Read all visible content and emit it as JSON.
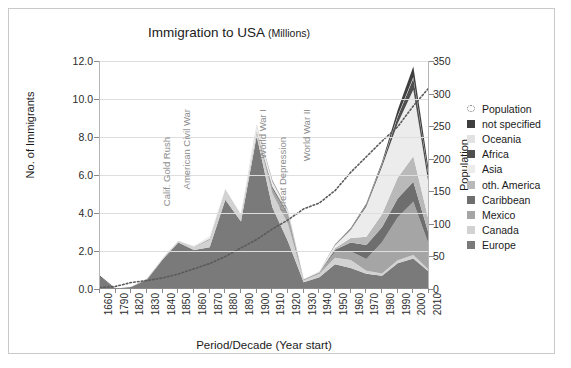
{
  "chart": {
    "title": "Immigration to USA",
    "title_unit": "(Millions)",
    "xlabel": "Period/Decade (Year start)",
    "ylabel_left": "No. of Immigrants",
    "ylabel_right": "Population"
  },
  "axes": {
    "left_ticks": [
      "0.0",
      "2.0",
      "4.0",
      "6.0",
      "8.0",
      "10.0",
      "12.0"
    ],
    "right_ticks": [
      "0",
      "50",
      "100",
      "150",
      "200",
      "250",
      "300",
      "350"
    ]
  },
  "legend": {
    "items": [
      {
        "label": "Population",
        "color": "#7d7d7d",
        "marker": "dotted-circle"
      },
      {
        "label": "not specified",
        "color": "#3f3f3f",
        "marker": "square"
      },
      {
        "label": "Oceania",
        "color": "#e2e2e2",
        "marker": "square"
      },
      {
        "label": "Africa",
        "color": "#4f4f4f",
        "marker": "square"
      },
      {
        "label": "Asia",
        "color": "#ececec",
        "marker": "square"
      },
      {
        "label": "oth. America",
        "color": "#b9b9b9",
        "marker": "square"
      },
      {
        "label": "Caribbean",
        "color": "#6e6e6e",
        "marker": "square"
      },
      {
        "label": "Mexico",
        "color": "#a5a5a5",
        "marker": "square"
      },
      {
        "label": "Canada",
        "color": "#d2d2d2",
        "marker": "square"
      },
      {
        "label": "Europe",
        "color": "#7a7a7a",
        "marker": "square"
      }
    ]
  },
  "annotations": [
    {
      "text": "Calif. Gold Rush",
      "x_year": "1850",
      "px": 152,
      "py": 128
    },
    {
      "text": "American Civil War",
      "x_year": "1860",
      "px": 172,
      "py": 100
    },
    {
      "text": "World War I",
      "x_year": "1910",
      "px": 248,
      "py": 100
    },
    {
      "text": "Great Depression",
      "x_year": "1930",
      "px": 268,
      "py": 128
    },
    {
      "text": "World War II",
      "x_year": "1940",
      "px": 292,
      "py": 100
    }
  ],
  "chart_data": {
    "type": "area",
    "title": "Immigration to USA (Millions)",
    "xlabel": "Period/Decade (Year start)",
    "ylabel": "No. of Immigrants",
    "ylabel_secondary": "Population",
    "ylim": [
      0,
      12
    ],
    "ylim_secondary": [
      0,
      350
    ],
    "grid": true,
    "legend_position": "right",
    "stacked": true,
    "categories": [
      "1660",
      "1790",
      "1820",
      "1830",
      "1840",
      "1850",
      "1860",
      "1870",
      "1880",
      "1890",
      "1900",
      "1910",
      "1920",
      "1930",
      "1940",
      "1950",
      "1960",
      "1970",
      "1980",
      "1990",
      "2000",
      "2010"
    ],
    "series": [
      {
        "name": "Europe",
        "color": "#7a7a7a",
        "values": [
          0.65,
          0.02,
          0.1,
          0.5,
          1.55,
          2.45,
          2.05,
          2.2,
          4.7,
          3.55,
          8.05,
          4.3,
          2.5,
          0.35,
          0.62,
          1.3,
          1.1,
          0.8,
          0.7,
          1.35,
          1.6,
          0.9
        ]
      },
      {
        "name": "Canada",
        "color": "#d2d2d2",
        "values": [
          0.0,
          0.0,
          0.01,
          0.02,
          0.04,
          0.06,
          0.15,
          0.38,
          0.49,
          0.32,
          0.18,
          0.74,
          0.92,
          0.11,
          0.17,
          0.35,
          0.43,
          0.16,
          0.11,
          0.16,
          0.19,
          0.1
        ]
      },
      {
        "name": "Mexico",
        "color": "#a5a5a5",
        "values": [
          0.0,
          0.0,
          0.0,
          0.01,
          0.01,
          0.01,
          0.02,
          0.05,
          0.02,
          0.01,
          0.05,
          0.22,
          0.46,
          0.02,
          0.06,
          0.3,
          0.45,
          0.62,
          1.65,
          2.25,
          2.8,
          1.3
        ]
      },
      {
        "name": "Caribbean",
        "color": "#6e6e6e",
        "values": [
          0.0,
          0.0,
          0.01,
          0.01,
          0.01,
          0.01,
          0.01,
          0.01,
          0.01,
          0.01,
          0.02,
          0.12,
          0.08,
          0.02,
          0.02,
          0.12,
          0.47,
          0.74,
          0.79,
          1.0,
          1.05,
          0.55
        ]
      },
      {
        "name": "oth. America",
        "color": "#b9b9b9",
        "values": [
          0.0,
          0.0,
          0.0,
          0.0,
          0.0,
          0.0,
          0.0,
          0.0,
          0.0,
          0.0,
          0.01,
          0.04,
          0.05,
          0.01,
          0.02,
          0.08,
          0.23,
          0.43,
          0.68,
          1.1,
          1.35,
          0.7
        ]
      },
      {
        "name": "Asia",
        "color": "#ececec",
        "values": [
          0.0,
          0.0,
          0.0,
          0.0,
          0.0,
          0.0,
          0.04,
          0.12,
          0.06,
          0.07,
          0.32,
          0.25,
          0.11,
          0.02,
          0.04,
          0.15,
          0.43,
          1.59,
          2.5,
          2.85,
          3.5,
          1.85
        ]
      },
      {
        "name": "Africa",
        "color": "#4f4f4f",
        "values": [
          0.0,
          0.0,
          0.0,
          0.0,
          0.0,
          0.0,
          0.0,
          0.0,
          0.0,
          0.0,
          0.0,
          0.01,
          0.01,
          0.0,
          0.0,
          0.01,
          0.03,
          0.08,
          0.14,
          0.35,
          0.6,
          0.4
        ]
      },
      {
        "name": "Oceania",
        "color": "#e2e2e2",
        "values": [
          0.0,
          0.0,
          0.0,
          0.0,
          0.0,
          0.0,
          0.0,
          0.01,
          0.01,
          0.01,
          0.01,
          0.01,
          0.01,
          0.0,
          0.0,
          0.01,
          0.02,
          0.03,
          0.04,
          0.06,
          0.07,
          0.04
        ]
      },
      {
        "name": "not specified",
        "color": "#3f3f3f",
        "values": [
          0.05,
          0.0,
          0.0,
          0.0,
          0.0,
          0.0,
          0.0,
          0.0,
          0.0,
          0.0,
          0.02,
          0.03,
          0.02,
          0.0,
          0.0,
          0.02,
          0.04,
          0.05,
          0.08,
          0.3,
          0.55,
          0.3
        ]
      }
    ],
    "secondary_series": {
      "name": "Population",
      "color": "#5a5a5a",
      "style": "dotted",
      "values": [
        2,
        4,
        10,
        13,
        17,
        23,
        31,
        39,
        50,
        63,
        76,
        92,
        106,
        123,
        132,
        151,
        179,
        203,
        227,
        249,
        281,
        309
      ]
    }
  }
}
